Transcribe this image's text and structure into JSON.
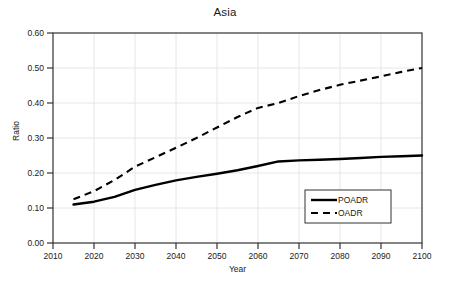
{
  "chart_data": {
    "type": "line",
    "title": "Asia",
    "xlabel": "Year",
    "ylabel": "Ratio",
    "xlim": [
      2010,
      2100
    ],
    "ylim": [
      0.0,
      0.6
    ],
    "grid": true,
    "legend_position": "bottom-right",
    "xticks": [
      "2010",
      "2020",
      "2030",
      "2040",
      "2050",
      "2060",
      "2070",
      "2080",
      "2090",
      "2100"
    ],
    "yticks": [
      "0.00",
      "0.10",
      "0.20",
      "0.30",
      "0.40",
      "0.50",
      "0.60"
    ],
    "x": [
      2015,
      2020,
      2025,
      2030,
      2035,
      2040,
      2045,
      2050,
      2055,
      2060,
      2065,
      2070,
      2075,
      2080,
      2085,
      2090,
      2095,
      2100
    ],
    "series": [
      {
        "name": "POADR",
        "style": "solid",
        "color": "#000000",
        "values": [
          0.11,
          0.118,
          0.132,
          0.152,
          0.166,
          0.179,
          0.189,
          0.198,
          0.208,
          0.22,
          0.233,
          0.236,
          0.238,
          0.24,
          0.243,
          0.246,
          0.248,
          0.25
        ]
      },
      {
        "name": "OADR",
        "style": "dashed",
        "color": "#000000",
        "values": [
          0.125,
          0.148,
          0.18,
          0.218,
          0.245,
          0.272,
          0.3,
          0.33,
          0.36,
          0.386,
          0.4,
          0.42,
          0.437,
          0.452,
          0.464,
          0.476,
          0.489,
          0.5
        ]
      }
    ]
  },
  "legend": {
    "entries": [
      {
        "label": "POADR",
        "style": "solid"
      },
      {
        "label": "OADR",
        "style": "dashed"
      }
    ]
  }
}
